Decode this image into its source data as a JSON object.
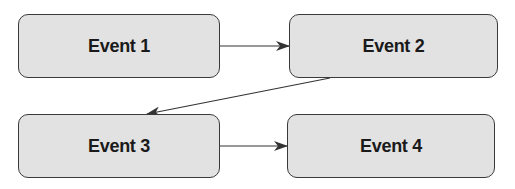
{
  "diagram": {
    "type": "flow",
    "nodes": [
      {
        "id": "event1",
        "label": "Event 1"
      },
      {
        "id": "event2",
        "label": "Event 2"
      },
      {
        "id": "event3",
        "label": "Event 3"
      },
      {
        "id": "event4",
        "label": "Event 4"
      }
    ],
    "edges": [
      {
        "from": "event1",
        "to": "event2"
      },
      {
        "from": "event2",
        "to": "event3"
      },
      {
        "from": "event3",
        "to": "event4"
      }
    ],
    "colors": {
      "node_fill": "#e2e2e2",
      "node_border": "#3a3a3a",
      "text": "#1a1a1a",
      "arrow": "#333333"
    }
  }
}
